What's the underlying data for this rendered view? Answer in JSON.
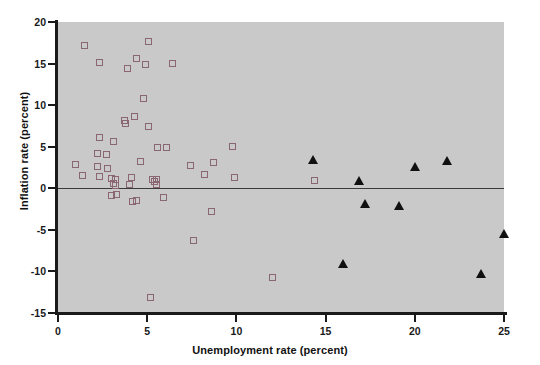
{
  "chart_data": {
    "type": "scatter",
    "title": "",
    "xlabel": "Unemployment rate (percent)",
    "ylabel": "Inflation rate (percent)",
    "xlim": [
      0,
      25
    ],
    "ylim": [
      -15,
      20
    ],
    "xticks": [
      0,
      5,
      10,
      15,
      20,
      25
    ],
    "yticks": [
      20,
      15,
      10,
      5,
      0,
      -5,
      -10,
      -15
    ],
    "xtick_labels": [
      "0",
      "5",
      "10",
      "15",
      "20",
      "25"
    ],
    "ytick_labels": [
      "20",
      "15",
      "10",
      "5",
      "0",
      "-5",
      "-10",
      "-15"
    ],
    "grid": false,
    "legend": "none",
    "reference_line_y": 0,
    "plot_background": "#c9c9c9",
    "series": [
      {
        "name": "open-square-group",
        "marker": "open-square",
        "color": "#8a6672",
        "points": [
          [
            1.5,
            17.2
          ],
          [
            5.1,
            17.6
          ],
          [
            2.3,
            15.1
          ],
          [
            3.9,
            14.4
          ],
          [
            4.4,
            15.6
          ],
          [
            4.9,
            14.9
          ],
          [
            6.4,
            15.0
          ],
          [
            4.8,
            10.8
          ],
          [
            3.7,
            8.1
          ],
          [
            3.8,
            7.8
          ],
          [
            4.3,
            8.6
          ],
          [
            5.1,
            7.4
          ],
          [
            2.3,
            6.1
          ],
          [
            3.1,
            5.6
          ],
          [
            5.6,
            4.9
          ],
          [
            6.1,
            4.9
          ],
          [
            9.8,
            5.0
          ],
          [
            2.2,
            4.2
          ],
          [
            2.7,
            4.1
          ],
          [
            1.0,
            2.9
          ],
          [
            2.2,
            2.6
          ],
          [
            2.8,
            2.4
          ],
          [
            4.6,
            3.2
          ],
          [
            7.4,
            2.8
          ],
          [
            8.7,
            3.1
          ],
          [
            1.4,
            1.5
          ],
          [
            2.3,
            1.4
          ],
          [
            3.0,
            1.2
          ],
          [
            3.2,
            1.0
          ],
          [
            4.1,
            1.3
          ],
          [
            5.3,
            1.1
          ],
          [
            5.5,
            1.0
          ],
          [
            5.4,
            0.8
          ],
          [
            5.5,
            0.5
          ],
          [
            3.1,
            0.6
          ],
          [
            3.2,
            0.3
          ],
          [
            4.0,
            0.4
          ],
          [
            8.2,
            1.6
          ],
          [
            9.9,
            1.3
          ],
          [
            14.4,
            0.9
          ],
          [
            3.0,
            -0.9
          ],
          [
            3.3,
            -0.7
          ],
          [
            4.2,
            -1.6
          ],
          [
            4.4,
            -1.5
          ],
          [
            5.9,
            -1.1
          ],
          [
            8.6,
            -2.8
          ],
          [
            7.6,
            -6.3
          ],
          [
            12.0,
            -10.7
          ],
          [
            5.2,
            -13.1
          ]
        ]
      },
      {
        "name": "filled-triangle-group",
        "marker": "filled-triangle",
        "color": "#101010",
        "points": [
          [
            14.3,
            3.5
          ],
          [
            16.9,
            0.9
          ],
          [
            20.0,
            2.6
          ],
          [
            21.8,
            3.4
          ],
          [
            17.2,
            -1.8
          ],
          [
            19.1,
            -2.1
          ],
          [
            16.0,
            -9.1
          ],
          [
            23.7,
            -10.2
          ],
          [
            25.0,
            -5.4
          ]
        ]
      }
    ]
  }
}
